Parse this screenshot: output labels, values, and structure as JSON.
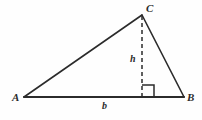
{
  "figure": {
    "kind": "geometry-diagram",
    "background_color": "#fefefe",
    "stroke_color": "#2b2b2b",
    "label_color": "#2b2b2b",
    "width": 202,
    "height": 120
  },
  "vertices": [
    {
      "name": "A",
      "label": "A",
      "x": 24,
      "y": 97
    },
    {
      "name": "B",
      "label": "B",
      "x": 184,
      "y": 97
    },
    {
      "name": "C",
      "label": "C",
      "x": 142,
      "y": 15
    }
  ],
  "foot_of_altitude": {
    "name": "D",
    "label": "",
    "x": 142,
    "y": 97
  },
  "sides": [
    {
      "name": "side-AC",
      "from": "A",
      "to": "C",
      "style": "solid",
      "label": ""
    },
    {
      "name": "side-CB",
      "from": "C",
      "to": "B",
      "style": "solid",
      "label": ""
    },
    {
      "name": "side-AB",
      "from": "A",
      "to": "B",
      "style": "solid",
      "label": "b"
    }
  ],
  "altitude": {
    "name": "altitude-CD",
    "from": "C",
    "to": "D",
    "style": "dashed",
    "label": "h",
    "dash_pattern": "4 3"
  },
  "right_angle": {
    "name": "right-angle-marker",
    "at": "D",
    "size": 12,
    "opens_toward": "B"
  },
  "labels": {
    "A": "A",
    "B": "B",
    "C": "C",
    "height": "h",
    "base": "b"
  }
}
